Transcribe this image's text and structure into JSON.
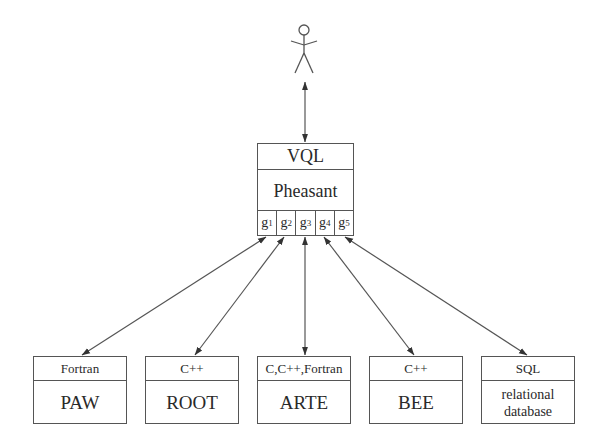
{
  "diagram": {
    "actor": {
      "label": "user",
      "icon": "stick-figure-icon"
    },
    "central": {
      "header": "VQL",
      "name": "Pheasant",
      "ports": [
        {
          "base": "g",
          "sub": "1"
        },
        {
          "base": "g",
          "sub": "2"
        },
        {
          "base": "g",
          "sub": "3"
        },
        {
          "base": "g",
          "sub": "4"
        },
        {
          "base": "g",
          "sub": "5"
        }
      ]
    },
    "backends": [
      {
        "language": "Fortran",
        "name": "PAW"
      },
      {
        "language": "C++",
        "name": "ROOT"
      },
      {
        "language": "C,C++,Fortran",
        "name": "ARTE"
      },
      {
        "language": "C++",
        "name": "BEE"
      },
      {
        "language": "SQL",
        "name": "relational database"
      }
    ],
    "connections": [
      {
        "from": "user",
        "to": "Pheasant",
        "type": "bidirectional-arrow"
      },
      {
        "from": "g1",
        "to": "PAW",
        "type": "bidirectional-arrow"
      },
      {
        "from": "g2",
        "to": "ROOT",
        "type": "bidirectional-arrow"
      },
      {
        "from": "g3",
        "to": "ARTE",
        "type": "bidirectional-arrow"
      },
      {
        "from": "g4",
        "to": "BEE",
        "type": "bidirectional-arrow"
      },
      {
        "from": "g5",
        "to": "relational database",
        "type": "bidirectional-arrow"
      }
    ],
    "colors": {
      "line": "#555555",
      "text": "#2a2a2a",
      "background": "#ffffff"
    }
  }
}
